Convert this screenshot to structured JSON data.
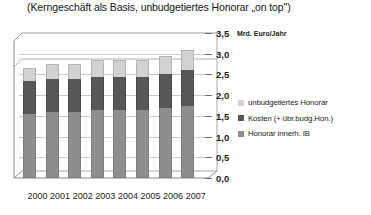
{
  "title": "(Kerngeschäft als Basis, unbudgetiertes Honorar „on top\")",
  "axis": {
    "unit_label": "Mrd. Euro/Jahr",
    "y_ticks": [
      "0,0",
      "0,5",
      "1,0",
      "1,5",
      "2,0",
      "2,5",
      "3,0",
      "3,5"
    ]
  },
  "legend": {
    "items": [
      {
        "label": "unbudgetiertes Honorar",
        "color": "#d2d2d2"
      },
      {
        "label": "Kosten (+ übr.budg.Hon.)",
        "color": "#575757"
      },
      {
        "label": "Honorar innerh. IB",
        "color": "#8e8e8e"
      }
    ]
  },
  "chart_data": {
    "type": "bar",
    "subtype": "stacked-column",
    "title": "(Kerngeschäft als Basis, unbudgetiertes Honorar „on top\")",
    "xlabel": "",
    "ylabel": "Mrd. Euro/Jahr",
    "ylim": [
      0,
      3.5
    ],
    "ytick_step": 0.5,
    "grid": true,
    "legend_position": "right",
    "categories": [
      "2000",
      "2001",
      "2002",
      "2003",
      "2004",
      "2005",
      "2006",
      "2007"
    ],
    "series": [
      {
        "name": "Honorar innerh. IB",
        "color": "#8e8e8e",
        "values": [
          1.55,
          1.6,
          1.6,
          1.65,
          1.65,
          1.65,
          1.7,
          1.75
        ]
      },
      {
        "name": "Kosten (+ übr.budg.Hon.)",
        "color": "#575757",
        "values": [
          0.8,
          0.8,
          0.8,
          0.8,
          0.8,
          0.8,
          0.8,
          0.85
        ]
      },
      {
        "name": "unbudgetiertes Honorar",
        "color": "#d2d2d2",
        "values": [
          0.3,
          0.35,
          0.35,
          0.4,
          0.4,
          0.4,
          0.45,
          0.5
        ]
      }
    ],
    "totals": [
      2.65,
      2.75,
      2.75,
      2.85,
      2.85,
      2.85,
      2.95,
      3.1
    ]
  }
}
